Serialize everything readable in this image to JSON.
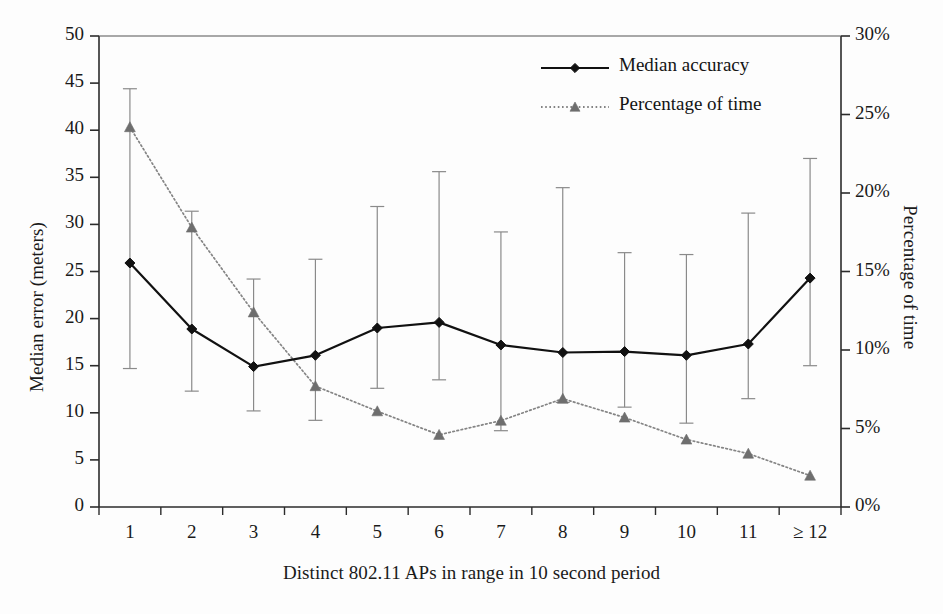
{
  "chart_data": {
    "type": "line",
    "title": "",
    "xlabel": "Distinct 802.11 APs in range in 10 second period",
    "ylabel": "Median error (meters)",
    "y2label": "Percentage of time",
    "categories": [
      "1",
      "2",
      "3",
      "4",
      "5",
      "6",
      "7",
      "8",
      "9",
      "10",
      "11",
      "≥ 12"
    ],
    "ylim": [
      0,
      50
    ],
    "yticks": [
      "0",
      "5",
      "10",
      "15",
      "20",
      "25",
      "30",
      "35",
      "40",
      "45",
      "50"
    ],
    "y2lim": [
      0,
      30
    ],
    "y2ticks": [
      "0%",
      "5%",
      "10%",
      "15%",
      "20%",
      "25%",
      "30%"
    ],
    "grid": false,
    "legend_position": "top-center-right",
    "series": [
      {
        "name": "Median accuracy",
        "axis": "left",
        "marker": "diamond",
        "color": "#111111",
        "linestyle": "solid",
        "values": [
          25.9,
          18.9,
          14.9,
          16.1,
          19.0,
          19.6,
          17.2,
          16.4,
          16.5,
          16.1,
          17.3,
          24.3
        ],
        "error_upper": [
          44.4,
          31.4,
          24.2,
          26.3,
          31.9,
          35.6,
          29.2,
          33.9,
          27.0,
          26.8,
          31.2,
          37.0
        ],
        "error_lower": [
          14.7,
          12.3,
          10.2,
          9.2,
          12.6,
          13.5,
          8.1,
          11.1,
          10.6,
          8.9,
          11.5,
          15.0
        ]
      },
      {
        "name": "Percentage of time",
        "axis": "right",
        "marker": "triangle",
        "color": "#6e6e6e",
        "linestyle": "dotted",
        "values_left_scale": [
          40.4,
          29.6,
          20.6,
          12.9,
          10.2,
          7.6,
          9.1,
          11.5,
          9.5,
          7.1,
          5.7,
          3.4
        ],
        "values": [
          24.2,
          17.8,
          12.4,
          7.7,
          6.1,
          4.6,
          5.5,
          6.9,
          5.7,
          4.3,
          3.4,
          2.0
        ]
      }
    ]
  },
  "legend": {
    "entries": [
      {
        "label": "Median accuracy",
        "color": "#111111",
        "marker": "diamond",
        "style": "solid"
      },
      {
        "label": "Percentage of time",
        "color": "#6e6e6e",
        "marker": "triangle",
        "style": "dotted"
      }
    ]
  },
  "colors": {
    "accuracy_series": "#111111",
    "percentage_series": "#6e6e6e",
    "axis": "#2b2b2b",
    "errorbar": "#8a8a8a",
    "background": "#fdfdfd"
  }
}
